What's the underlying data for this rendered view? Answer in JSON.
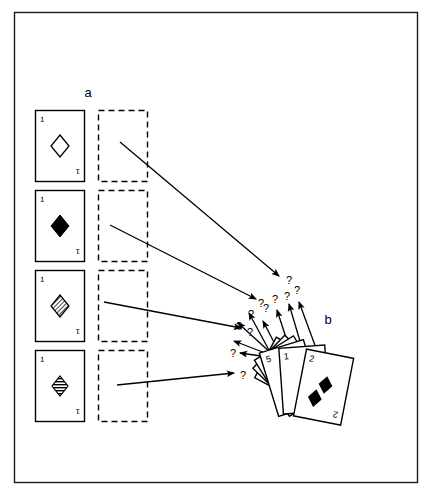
{
  "figure": {
    "caption_labels": {
      "panel_a": "a",
      "panel_b": "b"
    },
    "frame": {
      "stroke_color": "#1a1a1a",
      "background": "#ffffff",
      "x": 14,
      "y": 12,
      "width": 404,
      "height": 471
    }
  },
  "panel_a": {
    "label": "a",
    "label_x": 88,
    "label_y": 97,
    "stimulus_cards": [
      {
        "index": 0,
        "rank_label": "1",
        "suit": "diamond",
        "fill_style": "outline",
        "x": 35,
        "y": 110,
        "width": 50,
        "height": 72
      },
      {
        "index": 1,
        "rank_label": "1",
        "suit": "diamond",
        "fill_style": "solid",
        "x": 35,
        "y": 190,
        "width": 50,
        "height": 72
      },
      {
        "index": 2,
        "rank_label": "1",
        "suit": "diamond",
        "fill_style": "diagonal-hatch",
        "x": 35,
        "y": 270,
        "width": 50,
        "height": 72
      },
      {
        "index": 3,
        "rank_label": "1",
        "suit": "diamond",
        "fill_style": "horizontal-hatch",
        "x": 35,
        "y": 350,
        "width": 50,
        "height": 72
      }
    ],
    "placeholder_boxes": [
      {
        "index": 0,
        "x": 98,
        "y": 110,
        "width": 50,
        "height": 72
      },
      {
        "index": 1,
        "x": 98,
        "y": 190,
        "width": 50,
        "height": 72
      },
      {
        "index": 2,
        "x": 98,
        "y": 270,
        "width": 50,
        "height": 72
      },
      {
        "index": 3,
        "x": 98,
        "y": 350,
        "width": 50,
        "height": 72
      }
    ]
  },
  "panel_b": {
    "label": "b",
    "label_x": 328,
    "label_y": 324,
    "fan_cards": [
      {
        "index": 0,
        "rank_label": "3",
        "rotation": -62,
        "x": 248,
        "y": 362
      },
      {
        "index": 1,
        "rank_label": "7",
        "rotation": -47,
        "x": 258,
        "y": 356
      },
      {
        "index": 2,
        "rank_label": "4",
        "rotation": -33,
        "x": 270,
        "y": 352
      },
      {
        "index": 3,
        "rank_label": "5",
        "rotation": -16,
        "x": 284,
        "y": 348
      },
      {
        "index": 4,
        "rank_label": "1",
        "rotation": -4,
        "x": 301,
        "y": 348
      },
      {
        "index": 5,
        "rank_label": "2",
        "rotation": 12,
        "x": 318,
        "y": 350,
        "pip_count": 2,
        "suit": "diamond"
      }
    ]
  },
  "long_arrows": [
    {
      "index": 0,
      "x1": 120,
      "y1": 142,
      "x2": 281,
      "y2": 277,
      "marker_label": "?"
    },
    {
      "index": 1,
      "x1": 110,
      "y1": 225,
      "x2": 258,
      "y2": 300,
      "marker_label": "?"
    },
    {
      "index": 2,
      "x1": 104,
      "y1": 302,
      "x2": 243,
      "y2": 329,
      "marker_label": "?"
    },
    {
      "index": 3,
      "x1": 117,
      "y1": 385,
      "x2": 236,
      "y2": 374,
      "marker_label": "?"
    }
  ],
  "short_arrows": [
    {
      "index": 0,
      "x1": 269,
      "y1": 352,
      "x2": 249,
      "y2": 311,
      "marker_label": "?"
    },
    {
      "index": 1,
      "x1": 272,
      "y1": 354,
      "x2": 237,
      "y2": 322,
      "marker_label": "?"
    },
    {
      "index": 2,
      "x1": 272,
      "y1": 356,
      "x2": 232,
      "y2": 340,
      "marker_label": "?"
    },
    {
      "index": 3,
      "x1": 274,
      "y1": 357,
      "x2": 238,
      "y2": 352,
      "marker_label": "?"
    },
    {
      "index": 4,
      "x1": 278,
      "y1": 352,
      "x2": 262,
      "y2": 319,
      "marker_label": "?"
    },
    {
      "index": 5,
      "x1": 288,
      "y1": 350,
      "x2": 276,
      "y2": 308,
      "marker_label": "?"
    },
    {
      "index": 6,
      "x1": 300,
      "y1": 348,
      "x2": 288,
      "y2": 302,
      "marker_label": "?"
    },
    {
      "index": 7,
      "x1": 315,
      "y1": 348,
      "x2": 297,
      "y2": 300,
      "marker_label": "?"
    }
  ],
  "question_marks": [
    {
      "index": 0,
      "text": "?",
      "x": 285,
      "y": 283
    },
    {
      "index": 1,
      "text": "?",
      "x": 257,
      "y": 305
    },
    {
      "index": 2,
      "text": "?",
      "x": 247,
      "y": 333
    },
    {
      "index": 3,
      "text": "?",
      "x": 240,
      "y": 375
    },
    {
      "index": 4,
      "text": "?",
      "x": 232,
      "y": 355
    },
    {
      "index": 5,
      "text": "?",
      "x": 236,
      "y": 327
    },
    {
      "index": 6,
      "text": "?",
      "x": 247,
      "y": 316
    },
    {
      "index": 7,
      "text": "?",
      "x": 262,
      "y": 310
    },
    {
      "index": 8,
      "text": "?",
      "x": 271,
      "y": 301
    },
    {
      "index": 9,
      "text": "?",
      "x": 283,
      "y": 298
    },
    {
      "index": 10,
      "text": "?",
      "x": 293,
      "y": 292
    }
  ]
}
